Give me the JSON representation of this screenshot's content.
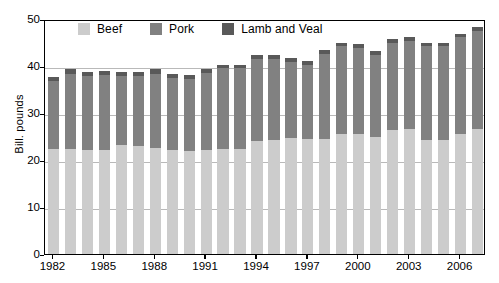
{
  "chart_data": {
    "type": "bar",
    "subtype": "stacked-bar",
    "title": "",
    "xlabel": "",
    "ylabel": "Bill. pounds",
    "ylim": [
      0,
      50
    ],
    "yticks": [
      0,
      10,
      20,
      30,
      40,
      50
    ],
    "grid": true,
    "legend_position": "top-inside",
    "categories": [
      "1982",
      "1983",
      "1984",
      "1985",
      "1986",
      "1987",
      "1988",
      "1989",
      "1990",
      "1991",
      "1992",
      "1993",
      "1994",
      "1995",
      "1996",
      "1997",
      "1998",
      "1999",
      "2000",
      "2001",
      "2002",
      "2003",
      "2004",
      "2005",
      "2006",
      "2007"
    ],
    "xtick_labels": [
      "1982",
      "1985",
      "1988",
      "1991",
      "1994",
      "1997",
      "2000",
      "2003",
      "2006"
    ],
    "series": [
      {
        "name": "Beef",
        "color": "#cccccc",
        "values": [
          22.3,
          22.3,
          22.2,
          22.2,
          23.2,
          22.9,
          22.5,
          22.1,
          21.9,
          22.2,
          22.3,
          22.4,
          24.0,
          24.2,
          24.7,
          24.5,
          24.5,
          25.6,
          25.5,
          25.0,
          26.3,
          26.5,
          24.3,
          24.3,
          25.5,
          26.5
        ]
      },
      {
        "name": "Pork",
        "color": "#818181",
        "values": [
          14.5,
          16.0,
          15.6,
          15.8,
          14.6,
          14.9,
          15.9,
          15.4,
          15.4,
          16.4,
          17.2,
          17.1,
          17.4,
          17.3,
          16.2,
          15.7,
          18.1,
          18.6,
          18.3,
          17.4,
          18.7,
          18.8,
          19.9,
          19.9,
          20.6,
          21.0
        ]
      },
      {
        "name": "Lamb and Veal",
        "color": "#595959",
        "values": [
          0.9,
          1.0,
          1.0,
          1.0,
          1.0,
          0.9,
          0.9,
          0.8,
          0.8,
          0.8,
          0.8,
          0.8,
          0.9,
          0.9,
          0.9,
          0.9,
          0.8,
          0.8,
          0.8,
          0.8,
          0.8,
          0.8,
          0.7,
          0.7,
          0.7,
          0.7
        ]
      }
    ]
  },
  "legend": {
    "items": [
      {
        "label": "Beef",
        "color": "#cccccc"
      },
      {
        "label": "Pork",
        "color": "#818181"
      },
      {
        "label": "Lamb and Veal",
        "color": "#595959"
      }
    ]
  },
  "axis": {
    "y_title": "Bill. pounds"
  }
}
